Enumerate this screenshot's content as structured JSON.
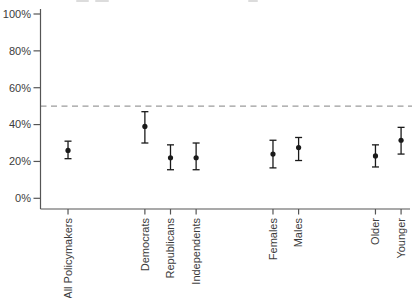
{
  "page": {
    "background": "#ffffff",
    "width": 412,
    "height": 298
  },
  "decor": {
    "cropped_title_marks": [
      {
        "x": 76,
        "w": 13
      },
      {
        "x": 95,
        "w": 14
      },
      {
        "x": 248,
        "w": 10
      }
    ],
    "mark_color": "#dcdcdc"
  },
  "chart_data": {
    "type": "scatter",
    "subtype": "point-estimates-with-error-bars",
    "title": "",
    "xlabel": "",
    "ylabel": "",
    "grid": false,
    "legend": "none",
    "ylim": [
      0,
      100
    ],
    "y_ticks": {
      "values": [
        0,
        20,
        40,
        60,
        80,
        100
      ],
      "labels": [
        "0%",
        "20%",
        "40%",
        "60%",
        "80%",
        "100%"
      ]
    },
    "reference_line": {
      "value": 50,
      "style": "dashed",
      "color": "#9c9c9c"
    },
    "categories": [
      "All Policymakers",
      "Democrats",
      "Republicans",
      "Independents",
      "Females",
      "Males",
      "Older",
      "Younger"
    ],
    "points": [
      {
        "label": "All Policymakers",
        "slot": 1,
        "value": 26,
        "ci_low": 21.5,
        "ci_high": 31
      },
      {
        "label": "Democrats",
        "slot": 4,
        "value": 39,
        "ci_low": 30,
        "ci_high": 47
      },
      {
        "label": "Republicans",
        "slot": 5,
        "value": 22,
        "ci_low": 15.5,
        "ci_high": 29
      },
      {
        "label": "Independents",
        "slot": 6,
        "value": 22,
        "ci_low": 15.5,
        "ci_high": 30
      },
      {
        "label": "Females",
        "slot": 9,
        "value": 24,
        "ci_low": 16.5,
        "ci_high": 31.5
      },
      {
        "label": "Males",
        "slot": 10,
        "value": 27.5,
        "ci_low": 20.5,
        "ci_high": 33
      },
      {
        "label": "Older",
        "slot": 13,
        "value": 23,
        "ci_low": 17,
        "ci_high": 29
      },
      {
        "label": "Younger",
        "slot": 14,
        "value": 31.5,
        "ci_low": 24,
        "ci_high": 38.5
      }
    ],
    "colors": {
      "point": "#1a1a1a",
      "error_bar": "#1a1a1a",
      "axis": "#555555",
      "tick_text": "#3c3c3c"
    }
  }
}
